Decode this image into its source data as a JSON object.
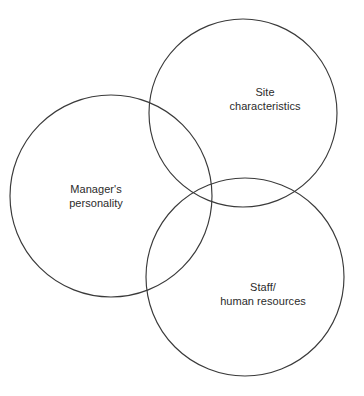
{
  "diagram": {
    "type": "venn",
    "canvas": {
      "width": 364,
      "height": 396
    },
    "background_color": "#ffffff",
    "stroke_color": "#3a3a3a",
    "text_color": "#2b2b2b",
    "sets": [
      {
        "id": "managers-personality",
        "label": "Manager's\npersonality",
        "label_line_1": "Manager's",
        "label_line_2": "personality",
        "cx": 111,
        "cy": 196,
        "r": 101,
        "label_x": 96,
        "label_y": 196
      },
      {
        "id": "site-characteristics",
        "label": "Site\ncharacteristics",
        "label_line_1": "Site",
        "label_line_2": "characteristics",
        "cx": 243,
        "cy": 113,
        "r": 94,
        "label_x": 265,
        "label_y": 99
      },
      {
        "id": "staff-human-resources",
        "label": "Staff/\nhuman resources",
        "label_line_1": "Staff/",
        "label_line_2": "human resources",
        "cx": 245,
        "cy": 277,
        "r": 99,
        "label_x": 263,
        "label_y": 294
      }
    ]
  }
}
